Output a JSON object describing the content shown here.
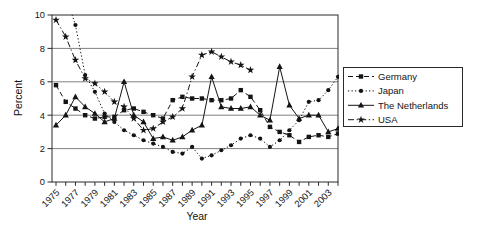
{
  "colors": {
    "ink": "#141414",
    "grid": "#4a4a4a",
    "frame": "#2a2a2a",
    "background": "#ffffff"
  },
  "chart_data": {
    "type": "line",
    "title": "",
    "xlabel": "Year",
    "ylabel": "Percent",
    "ylim": [
      0,
      10
    ],
    "x_range": [
      1975,
      2004
    ],
    "grid": "horizontal",
    "legend_position": "right",
    "yticks": [
      0,
      2,
      4,
      6,
      8,
      10
    ],
    "ytick_labels": [
      "0",
      "2",
      "4",
      "6",
      "8",
      "10"
    ],
    "xtick_years": [
      1975,
      1977,
      1979,
      1981,
      1983,
      1985,
      1987,
      1989,
      1991,
      1993,
      1995,
      1997,
      1999,
      2001,
      2003
    ],
    "xtick_labels": [
      "1975",
      "1977",
      "1979",
      "1981",
      "1983",
      "1985",
      "1987",
      "1989",
      "1991",
      "1993",
      "1995",
      "1997",
      "1999",
      "2001",
      "2003"
    ],
    "series": [
      {
        "name": "Germany",
        "marker": "square",
        "line_style": "dashed",
        "start_year": 1975,
        "values": [
          5.8,
          4.8,
          4.4,
          4.0,
          3.8,
          3.9,
          3.9,
          4.3,
          4.4,
          4.2,
          4.0,
          3.8,
          4.9,
          5.1,
          5.0,
          5.0,
          4.9,
          4.9,
          5.0,
          5.5,
          5.1,
          4.3,
          3.3,
          3.0,
          2.8,
          2.4,
          2.7,
          2.8,
          2.7,
          2.9
        ]
      },
      {
        "name": "Japan",
        "marker": "circle",
        "line_style": "dotted",
        "start_year": 1975,
        "values": [
          12.8,
          11.2,
          9.4,
          6.4,
          5.4,
          4.1,
          3.6,
          3.1,
          2.8,
          2.5,
          2.3,
          2.1,
          1.8,
          1.7,
          2.1,
          1.4,
          1.6,
          1.9,
          2.2,
          2.6,
          2.8,
          2.6,
          2.1,
          2.5,
          3.1,
          3.7,
          4.8,
          4.9,
          5.5,
          6.3
        ]
      },
      {
        "name": "The Netherlands",
        "marker": "triangle",
        "line_style": "solid",
        "start_year": 1975,
        "values": [
          3.4,
          4.0,
          5.1,
          4.5,
          4.1,
          3.6,
          3.8,
          6.0,
          4.0,
          3.6,
          2.6,
          2.7,
          2.5,
          2.7,
          3.1,
          3.4,
          6.3,
          4.5,
          4.4,
          4.4,
          4.5,
          4.0,
          3.7,
          6.9,
          4.6,
          3.8,
          4.0,
          4.0,
          3.0,
          3.2
        ]
      },
      {
        "name": "USA",
        "marker": "star",
        "line_style": "dashdot",
        "start_year": 1975,
        "values": [
          9.7,
          8.7,
          7.3,
          6.2,
          5.9,
          5.4,
          4.8,
          4.5,
          3.8,
          3.1,
          3.2,
          3.6,
          3.9,
          4.4,
          6.3,
          7.6,
          7.8,
          7.5,
          7.2,
          7.0,
          6.7
        ]
      }
    ]
  }
}
